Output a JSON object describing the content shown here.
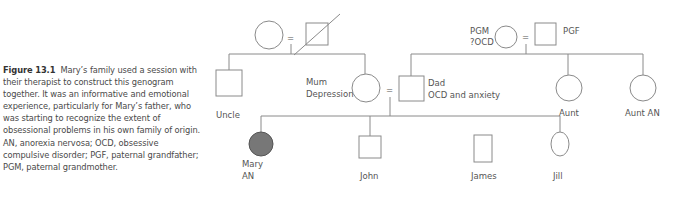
{
  "caption": {
    "figure_label": "Figure 13.1",
    "text": "Mary’s family used a session with their therapist to construct this genogram together. It was an informative and emotional experience, particularly for Mary’s father, who was starting to recognize the extent of obsessional problems in his own family of origin. AN, anorexia nervosa; OCD, obsessive compulsive disorder; PGF, paternal grandfather; PGM, paternal grandmother."
  },
  "genogram": {
    "marriage_symbol": "=",
    "maternal_grandmother": {
      "label": ""
    },
    "maternal_grandfather": {
      "label": "",
      "deceased": true
    },
    "uncle": {
      "label": "Uncle"
    },
    "mum": {
      "label_line1": "Mum",
      "label_line2": "Depression"
    },
    "dad": {
      "label_line1": "Dad",
      "label_line2": "OCD and anxiety"
    },
    "pgm": {
      "label_line1": "PGM",
      "label_line2": "?OCD"
    },
    "pgf": {
      "label": "PGF"
    },
    "aunt": {
      "label": "Aunt"
    },
    "aunt_an": {
      "label": "Aunt AN"
    },
    "mary": {
      "label_line1": "Mary",
      "label_line2": "AN",
      "affected_color": "#777777"
    },
    "john": {
      "label": "John"
    },
    "james": {
      "label": "James"
    },
    "jill": {
      "label": "Jill"
    }
  },
  "colors": {
    "line": "#8a8a8a",
    "text": "#4a4a4a",
    "affected_fill": "#777777"
  }
}
